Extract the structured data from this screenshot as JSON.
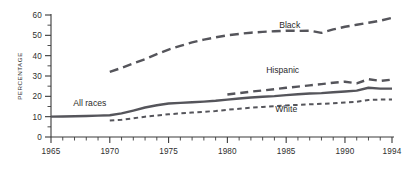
{
  "chart_data": {
    "type": "line",
    "title": "",
    "xlabel": "",
    "ylabel": "PERCENTAGE",
    "xlim": [
      1965,
      1994
    ],
    "ylim": [
      0,
      60
    ],
    "grid": false,
    "legend_position": "inline-annotations",
    "x_ticks_major": [
      1965,
      1970,
      1975,
      1980,
      1985,
      1990,
      1994
    ],
    "x_tick_labels": [
      "1965",
      "1970",
      "1975",
      "1980",
      "1985",
      "1990",
      "1994"
    ],
    "x_minor_tick_interval": 1,
    "y_ticks_major": [
      0,
      10,
      20,
      30,
      40,
      50,
      60
    ],
    "y_tick_labels": [
      "0",
      "10",
      "20",
      "30",
      "40",
      "50",
      "60"
    ],
    "y_minor_ticks": [
      5,
      15,
      25,
      35,
      45,
      55
    ],
    "series": [
      {
        "name": "All races",
        "label": "All races",
        "style": "solid",
        "color": "#55555b",
        "x": [
          1965,
          1966,
          1967,
          1968,
          1969,
          1970,
          1971,
          1972,
          1973,
          1974,
          1975,
          1976,
          1977,
          1978,
          1979,
          1980,
          1981,
          1982,
          1983,
          1984,
          1985,
          1986,
          1987,
          1988,
          1989,
          1990,
          1991,
          1992,
          1993,
          1994
        ],
        "values": [
          10.0,
          10.1,
          10.2,
          10.3,
          10.5,
          10.7,
          11.6,
          13.0,
          14.5,
          15.6,
          16.5,
          16.8,
          17.1,
          17.4,
          17.8,
          18.4,
          18.9,
          19.4,
          19.8,
          20.1,
          20.6,
          21.0,
          21.4,
          21.6,
          22.0,
          22.4,
          22.8,
          24.2,
          23.8,
          23.8
        ]
      },
      {
        "name": "Black",
        "label": "Black",
        "style": "dashed-long",
        "color": "#55555b",
        "x": [
          1970,
          1971,
          1972,
          1973,
          1974,
          1975,
          1976,
          1977,
          1978,
          1979,
          1980,
          1981,
          1982,
          1983,
          1984,
          1985,
          1986,
          1987,
          1988,
          1989,
          1990,
          1991,
          1992,
          1993,
          1994
        ],
        "values": [
          32.0,
          34.0,
          36.2,
          38.3,
          40.8,
          43.0,
          44.8,
          46.5,
          47.9,
          49.0,
          50.0,
          50.7,
          51.3,
          51.7,
          52.0,
          52.3,
          52.2,
          52.3,
          51.2,
          52.9,
          54.2,
          55.2,
          56.2,
          57.2,
          58.6
        ]
      },
      {
        "name": "Hispanic",
        "label": "Hispanic",
        "style": "dashed-medium",
        "color": "#55555b",
        "x": [
          1980,
          1981,
          1982,
          1983,
          1984,
          1985,
          1986,
          1987,
          1988,
          1989,
          1990,
          1991,
          1992,
          1993,
          1994
        ],
        "values": [
          20.9,
          21.6,
          22.3,
          22.9,
          23.5,
          24.2,
          24.8,
          25.4,
          26.0,
          26.7,
          27.2,
          26.4,
          28.4,
          27.6,
          28.2
        ]
      },
      {
        "name": "White",
        "label": "White",
        "style": "dashed-short",
        "color": "#55555b",
        "x": [
          1970,
          1971,
          1972,
          1973,
          1974,
          1975,
          1976,
          1977,
          1978,
          1979,
          1980,
          1981,
          1982,
          1983,
          1984,
          1985,
          1986,
          1987,
          1988,
          1989,
          1990,
          1991,
          1992,
          1993,
          1994
        ],
        "values": [
          8.1,
          8.5,
          9.2,
          10.0,
          10.6,
          11.2,
          11.6,
          12.0,
          12.4,
          12.8,
          13.4,
          13.9,
          14.4,
          14.8,
          15.1,
          15.5,
          15.8,
          16.1,
          16.3,
          16.6,
          17.0,
          17.3,
          18.2,
          18.4,
          18.5
        ]
      }
    ],
    "annotations": [
      {
        "text": "Black",
        "x": 1985.3,
        "y": 53.5
      },
      {
        "text": "Hispanic",
        "x": 1984.7,
        "y": 31.5
      },
      {
        "text": "White",
        "x": 1985.0,
        "y": 12.5
      },
      {
        "text": "All races",
        "x": 1968.3,
        "y": 15.3
      }
    ]
  }
}
